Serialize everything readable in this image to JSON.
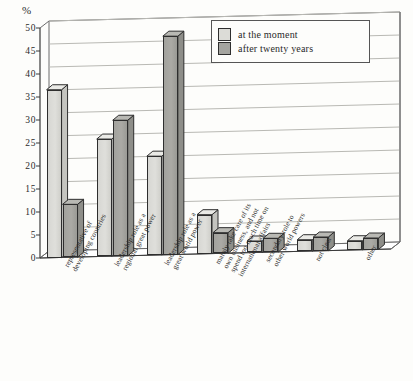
{
  "chart_data": {
    "type": "bar",
    "title": "",
    "subtitle": "",
    "xlabel": "",
    "ylabel": "%",
    "ylim": [
      0,
      50
    ],
    "yticks": [
      0,
      5,
      10,
      15,
      20,
      25,
      30,
      35,
      40,
      45,
      50
    ],
    "grid": true,
    "legend_position": "top-right",
    "categories": [
      "representative of\ndeveloping countries",
      "leadership role as a\nregional great power",
      "leadership role as a\ngreat world power",
      "mainly take care of its\nown business, and not\nspend too much time on\ninternational affairs",
      "secondary role to\nother world powers",
      "not clear",
      "other"
    ],
    "series": [
      {
        "name": "at the moment",
        "color": "#dcdcd7",
        "values": [
          36.5,
          25.5,
          21.5,
          8.5,
          2.5,
          2.5,
          2.0
        ]
      },
      {
        "name": "after twenty years",
        "color": "#a5a5a0",
        "values": [
          11.5,
          29.5,
          47.5,
          4.5,
          3.0,
          3.0,
          2.5
        ]
      }
    ]
  },
  "axis": {
    "unit_label": "%",
    "tick_labels": [
      "0",
      "5",
      "10",
      "15",
      "20",
      "25",
      "30",
      "35",
      "40",
      "45",
      "50"
    ]
  },
  "legend": {
    "entries": [
      {
        "label": "at the moment",
        "swatch": "light"
      },
      {
        "label": "after twenty years",
        "swatch": "dark"
      }
    ]
  }
}
